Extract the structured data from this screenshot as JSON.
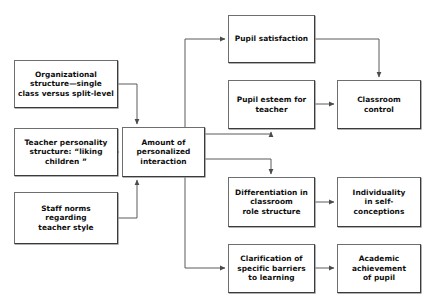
{
  "diagram": {
    "type": "flowchart",
    "title": "",
    "background_color": "#ffffff",
    "box_border_color": "#6d6e70",
    "edge_color": "#5a5b5d",
    "text_color": "#0d0d0d",
    "nodes": [
      {
        "id": "organizational-structure",
        "label": "Organizational\nstructure—single\nclass versus split-level",
        "x": 14,
        "y": 60,
        "w": 104,
        "h": 48
      },
      {
        "id": "teacher-personality",
        "label": "Teacher personality\nstructure: “liking\nchildren ”",
        "x": 14,
        "y": 128,
        "w": 104,
        "h": 48
      },
      {
        "id": "staff-norms",
        "label": "Staff norms\nregarding\nteacher style",
        "x": 14,
        "y": 192,
        "w": 104,
        "h": 52
      },
      {
        "id": "amount-personalized-interaction",
        "label": "Amount of\npersonalized\ninteraction",
        "x": 122,
        "y": 127,
        "w": 83,
        "h": 50
      },
      {
        "id": "pupil-satisfaction",
        "label": "Pupil satisfaction",
        "x": 228,
        "y": 15,
        "w": 87,
        "h": 48
      },
      {
        "id": "pupil-esteem",
        "label": "Pupil esteem for\nteacher",
        "x": 228,
        "y": 80,
        "w": 87,
        "h": 49
      },
      {
        "id": "classroom-control",
        "label": "Classroom control",
        "x": 337,
        "y": 80,
        "w": 84,
        "h": 49
      },
      {
        "id": "differentiation",
        "label": "Differentiation in\nclassroom\nrole structure",
        "x": 228,
        "y": 177,
        "w": 87,
        "h": 50
      },
      {
        "id": "individuality",
        "label": "Individuality\nin self-conceptions",
        "x": 337,
        "y": 177,
        "w": 84,
        "h": 50
      },
      {
        "id": "clarification",
        "label": "Clarification of\nspecific barriers\nto learning",
        "x": 228,
        "y": 244,
        "w": 87,
        "h": 49
      },
      {
        "id": "academic-achievement",
        "label": "Academic\nachievement\nof pupil",
        "x": 337,
        "y": 244,
        "w": 84,
        "h": 49
      }
    ],
    "edges": [
      {
        "id": "edge-org-to-amount",
        "from": "organizational-structure",
        "to": "amount-personalized-interaction",
        "path": "M 118,84 L 137,84 L 137,124",
        "arrow": "down"
      },
      {
        "id": "edge-teacher-to-amount",
        "from": "teacher-personality",
        "to": "amount-personalized-interaction",
        "path": "M 118,152 L 119,152",
        "arrow": "right"
      },
      {
        "id": "edge-staff-to-amount",
        "from": "staff-norms",
        "to": "amount-personalized-interaction",
        "path": "M 118,218 L 137,218 L 137,180",
        "arrow": "up"
      },
      {
        "id": "edge-amount-to-satisfaction",
        "from": "amount-personalized-interaction",
        "to": "pupil-satisfaction",
        "path": "M 185,127 L 185,39 L 225,39",
        "arrow": "right"
      },
      {
        "id": "edge-amount-to-esteem",
        "from": "amount-personalized-interaction",
        "to": "pupil-esteem",
        "path": "M 205,134 L 271,134 L 271,132",
        "arrow": "up"
      },
      {
        "id": "edge-amount-to-differentiation",
        "from": "amount-personalized-interaction",
        "to": "differentiation",
        "path": "M 205,159 L 271,159 L 271,174",
        "arrow": "down"
      },
      {
        "id": "edge-amount-to-clarification",
        "from": "amount-personalized-interaction",
        "to": "clarification",
        "path": "M 185,177 L 185,268 L 225,268",
        "arrow": "right"
      },
      {
        "id": "edge-satisfaction-to-control",
        "from": "pupil-satisfaction",
        "to": "classroom-control",
        "path": "M 315,39 L 379,39 L 379,77",
        "arrow": "down"
      },
      {
        "id": "edge-esteem-to-control",
        "from": "pupil-esteem",
        "to": "classroom-control",
        "path": "M 315,104 L 334,104",
        "arrow": "right"
      },
      {
        "id": "edge-differentiation-to-individuality",
        "from": "differentiation",
        "to": "individuality",
        "path": "M 315,202 L 334,202",
        "arrow": "right"
      },
      {
        "id": "edge-clarification-to-achievement",
        "from": "clarification",
        "to": "academic-achievement",
        "path": "M 315,268 L 334,268",
        "arrow": "right"
      }
    ]
  }
}
